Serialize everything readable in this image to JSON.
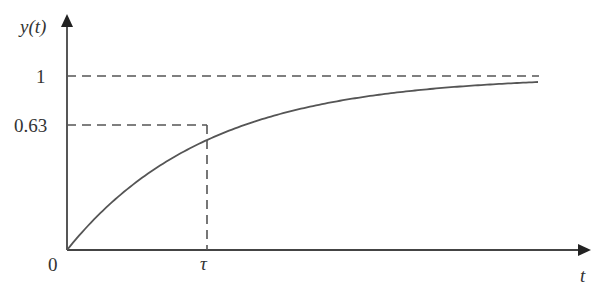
{
  "labels": {
    "y_axis": "y(t)",
    "x_axis": "t",
    "origin": "0",
    "y_tick_1": "1",
    "y_tick_063": "0.63",
    "x_tick_tau": "τ"
  },
  "chart_data": {
    "type": "line",
    "title": "",
    "xlabel": "t",
    "ylabel": "y(t)",
    "series": [
      {
        "name": "y(t) = 1 - e^(-t/τ)",
        "x_in_tau": [
          0,
          0.5,
          1,
          2,
          3,
          4,
          5
        ],
        "values": [
          0,
          0.39,
          0.63,
          0.86,
          0.95,
          0.98,
          0.99
        ]
      }
    ],
    "reference_lines": [
      {
        "axis": "y",
        "value": 1,
        "style": "dashed"
      },
      {
        "axis": "y",
        "value": 0.63,
        "style": "dashed"
      },
      {
        "axis": "x",
        "value": "τ",
        "style": "dashed"
      }
    ],
    "yticks": [
      "1",
      "0.63"
    ],
    "xticks": [
      "0",
      "τ"
    ],
    "ylim": [
      0,
      1.15
    ],
    "grid": false
  },
  "colors": {
    "line": "#555555",
    "text": "#333333"
  }
}
